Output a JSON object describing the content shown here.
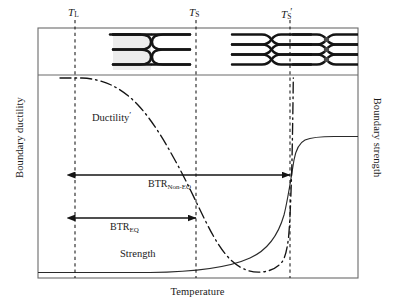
{
  "figure": {
    "type": "schematic-diagram"
  },
  "axes": {
    "x_label": "Temperature",
    "y_left_label": "Boundary ductility",
    "y_right_label": "Boundary strength"
  },
  "ticks": [
    {
      "id": "TL",
      "base": "T",
      "sub": "L",
      "prime": "",
      "x": 75
    },
    {
      "id": "TS",
      "base": "T",
      "sub": "S",
      "prime": "",
      "x": 196
    },
    {
      "id": "TSp",
      "base": "T",
      "sub": "S",
      "prime": "′",
      "x": 290
    }
  ],
  "curves": [
    {
      "name": "Ductility",
      "label": "Ductility",
      "prime": "′",
      "style": "dash-dot",
      "color": "#151515",
      "label_x": 92,
      "label_y": 116
    },
    {
      "name": "Strength",
      "label": "Strength",
      "prime": "",
      "style": "solid",
      "color": "#151515",
      "label_x": 120,
      "label_y": 254
    }
  ],
  "btr_ranges": [
    {
      "id": "btr-non-eq",
      "label": "BTR",
      "sub": "Non-EQ",
      "from_tick": "TL",
      "to_tick": "TSp",
      "x_start": 75,
      "x_end": 290,
      "y": 175,
      "label_x": 148,
      "label_y": 179
    },
    {
      "id": "btr-eq",
      "label": "BTR",
      "sub": "EQ",
      "from_tick": "TL",
      "to_tick": "TS",
      "x_start": 75,
      "x_end": 196,
      "y": 218,
      "label_x": 110,
      "label_y": 222
    }
  ],
  "microstructures": [
    {
      "id": "ms-1",
      "state": "continuous-liquid-film",
      "x": 113,
      "width": 37
    },
    {
      "id": "ms-2",
      "state": "continuous-liquid-film",
      "x": 152,
      "width": 37
    },
    {
      "id": "ms-3",
      "state": "pinched-liquid-pocket",
      "x": 232,
      "width": 47
    },
    {
      "id": "ms-4",
      "state": "solidified-boundary",
      "x": 293,
      "width": 47
    }
  ],
  "colors": {
    "frame": "#6b6b6b",
    "ink": "#151515",
    "liquid_fill": "#e8e8e8"
  }
}
